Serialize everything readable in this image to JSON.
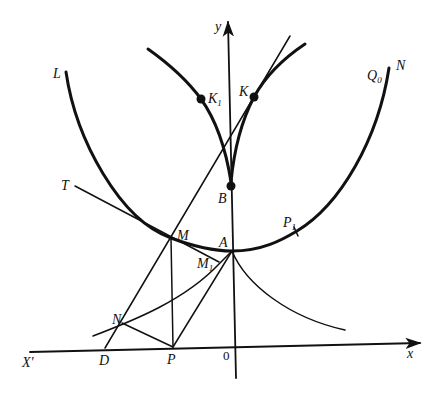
{
  "figure": {
    "type": "geometric construction with catenary curve, cusp curves and tangent lines",
    "axes": {
      "x_label": "x",
      "x_neg_label": "X'",
      "y_label": "y",
      "origin_label": "0"
    },
    "points": {
      "L": "L",
      "N_top": "N",
      "Q0": "Q",
      "Q0_sub": "0",
      "K": "K",
      "K1": "K",
      "K1_sub": "1",
      "B": "B",
      "T": "T",
      "M": "M",
      "A": "A",
      "P1": "P",
      "P1_sub": "1",
      "M1": "M",
      "M1_sub": "1",
      "N": "N",
      "D": "D",
      "P": "P"
    },
    "curves": [
      {
        "name": "catenary",
        "from": "L",
        "through": [
          "M",
          "A",
          "P1"
        ],
        "to": "N"
      },
      {
        "name": "evolute-left-branch",
        "from": "upper-left",
        "through": [
          "K1"
        ],
        "to": "B"
      },
      {
        "name": "evolute-right-branch",
        "from": "B",
        "through": [
          "K"
        ],
        "to": "upper-right"
      },
      {
        "name": "tractrix-right",
        "from": "A",
        "to": "lower-right"
      },
      {
        "name": "tractrix-left",
        "from": "lower-left",
        "through": [
          "N",
          "M1"
        ],
        "to": "A"
      }
    ],
    "segments": [
      {
        "name": "line-DM",
        "from": "D",
        "through": [
          "N",
          "M"
        ],
        "note": "extends beyond to top"
      },
      {
        "name": "tangent-TM",
        "from": "T",
        "through": [
          "M"
        ],
        "to": "M1"
      },
      {
        "name": "segment-MP",
        "from": "M",
        "to": "P"
      },
      {
        "name": "segment-NP",
        "from": "N",
        "to": "P"
      },
      {
        "name": "segment-PA",
        "from": "P",
        "through": [
          "M1"
        ],
        "to": "A"
      }
    ],
    "marked_dots": [
      "K",
      "K1",
      "B"
    ],
    "colors": {
      "ink": "#111111",
      "background": "#ffffff"
    }
  }
}
